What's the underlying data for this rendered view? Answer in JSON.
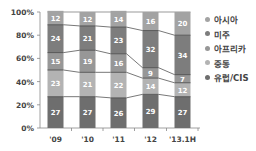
{
  "chart_data": {
    "type": "bar",
    "stacked": true,
    "title": "",
    "xlabel": "",
    "ylabel": "",
    "ylim": [
      0,
      100
    ],
    "yticks": [
      "0%",
      "20%",
      "40%",
      "60%",
      "80%",
      "100%"
    ],
    "categories": [
      "'09",
      "'10",
      "'11",
      "'12",
      "'13.1H"
    ],
    "series": [
      {
        "name": "유럽/CIS",
        "color": "#6e6e6e",
        "values": [
          27,
          27,
          26,
          29,
          27
        ]
      },
      {
        "name": "중동",
        "color": "#b3b3b3",
        "values": [
          23,
          21,
          22,
          14,
          12
        ]
      },
      {
        "name": "아프리카",
        "color": "#979797",
        "values": [
          15,
          19,
          16,
          9,
          7
        ]
      },
      {
        "name": "미주",
        "color": "#7d7d7d",
        "values": [
          24,
          21,
          23,
          32,
          34
        ]
      },
      {
        "name": "아시아",
        "color": "#a3a3a3",
        "values": [
          12,
          12,
          14,
          16,
          20
        ]
      }
    ],
    "legend_position": "right",
    "grid": false,
    "connector_lines": true
  },
  "legend": [
    {
      "label": "아시아",
      "color": "#a3a3a3"
    },
    {
      "label": "미주",
      "color": "#7d7d7d"
    },
    {
      "label": "아프리카",
      "color": "#979797"
    },
    {
      "label": "중동",
      "color": "#b3b3b3"
    },
    {
      "label": "유럽/CIS",
      "color": "#6e6e6e"
    }
  ]
}
